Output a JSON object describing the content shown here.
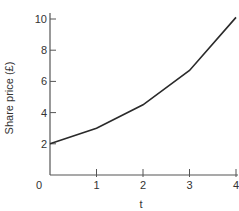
{
  "chart_data": {
    "type": "line",
    "title": "",
    "xlabel": "t",
    "ylabel": "Share price (£)",
    "x": [
      0,
      1,
      2,
      3,
      4
    ],
    "series": [
      {
        "name": "Share price",
        "values": [
          2.0,
          3.0,
          4.5,
          6.7,
          10.1
        ]
      }
    ],
    "xlim": [
      0,
      4
    ],
    "ylim": [
      0,
      10
    ],
    "xticks": [
      "0",
      "1",
      "2",
      "3",
      "4"
    ],
    "yticks": [
      "2",
      "4",
      "6",
      "8",
      "10"
    ],
    "origin_label": "0",
    "grid": false,
    "legend": "none"
  }
}
